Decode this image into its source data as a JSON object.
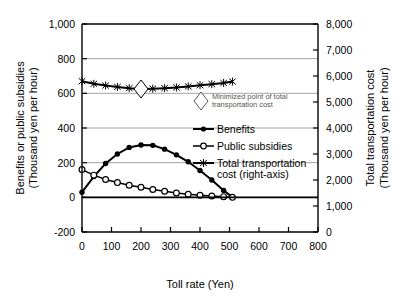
{
  "chart_data": {
    "type": "line",
    "title": "",
    "xlabel": "Toll rate (Yen)",
    "ylabel_left": "Benefits or public subsidies (Thousand yen per hour)",
    "ylabel_left_line1": "Benefits or public subsidies",
    "ylabel_left_line2": "(Thousand yen per hour)",
    "ylabel_right": "Total transportation cost (Thousand yen per hour)",
    "ylabel_right_line1": "Total transportation cost",
    "ylabel_right_line2": "(Thousand yen per hour)",
    "xlim": [
      0,
      800
    ],
    "ylim_left": [
      -200,
      1000
    ],
    "ylim_right": [
      0,
      8000
    ],
    "xticks": [
      "0",
      "100",
      "200",
      "300",
      "400",
      "500",
      "600",
      "700",
      "800"
    ],
    "xtick_values": [
      0,
      100,
      200,
      300,
      400,
      500,
      600,
      700,
      800
    ],
    "yticks_left": [
      "1,000",
      "800",
      "600",
      "400",
      "200",
      "0",
      "-200"
    ],
    "ytick_left_values": [
      1000,
      800,
      600,
      400,
      200,
      0,
      -200
    ],
    "yticks_right": [
      "8,000",
      "7,000",
      "6,000",
      "5,000",
      "4,000",
      "3,000",
      "2,000",
      "1,000",
      "0"
    ],
    "ytick_right_values": [
      8000,
      7000,
      6000,
      5000,
      4000,
      3000,
      2000,
      1000,
      0
    ],
    "grid": true,
    "grid_axis": "y-left",
    "legend_position": "inside-right",
    "series": [
      {
        "name": "Benefits",
        "axis": "left",
        "marker": "filled-circle",
        "x": [
          0,
          40,
          80,
          120,
          160,
          200,
          240,
          280,
          320,
          360,
          400,
          440,
          480,
          510
        ],
        "values": [
          30,
          120,
          195,
          250,
          288,
          302,
          300,
          278,
          245,
          205,
          155,
          100,
          40,
          0
        ]
      },
      {
        "name": "Public subsidies",
        "axis": "left",
        "marker": "open-circle",
        "x": [
          0,
          40,
          80,
          120,
          160,
          200,
          240,
          280,
          320,
          360,
          400,
          440,
          480,
          510
        ],
        "values": [
          160,
          128,
          103,
          85,
          70,
          58,
          45,
          35,
          25,
          18,
          12,
          8,
          4,
          0
        ]
      },
      {
        "name": "Total transportation cost (right-axis)",
        "axis": "right",
        "marker": "star",
        "x": [
          0,
          40,
          80,
          120,
          160,
          200,
          240,
          280,
          320,
          360,
          400,
          440,
          480,
          510
        ],
        "values_left_scale": [
          670,
          655,
          645,
          637,
          630,
          625,
          627,
          630,
          634,
          640,
          647,
          653,
          660,
          668
        ],
        "values": [
          5800,
          5700,
          5633,
          5580,
          5533,
          5500,
          5513,
          5533,
          5560,
          5600,
          5647,
          5687,
          5733,
          5787
        ]
      }
    ],
    "annotations": [
      {
        "name": "minimized-point",
        "marker": "open-diamond",
        "x": 200,
        "value_left_scale": 625,
        "label": "Minimized point of total transportation cost"
      }
    ],
    "legend": [
      {
        "label_line1": "Minimized point of total",
        "label_line2": "transportation cost",
        "marker": "open-diamond"
      },
      {
        "label_line1": "Benefits",
        "label_line2": "",
        "marker": "filled-circle"
      },
      {
        "label_line1": "Public subsidies",
        "label_line2": "",
        "marker": "open-circle"
      },
      {
        "label_line1": "Total transportation",
        "label_line2": "cost (right-axis)",
        "marker": "star"
      }
    ],
    "colors": {
      "series": "#000000",
      "grid": "#8d8d8d",
      "axis": "#000000",
      "background": "#ffffff"
    }
  }
}
